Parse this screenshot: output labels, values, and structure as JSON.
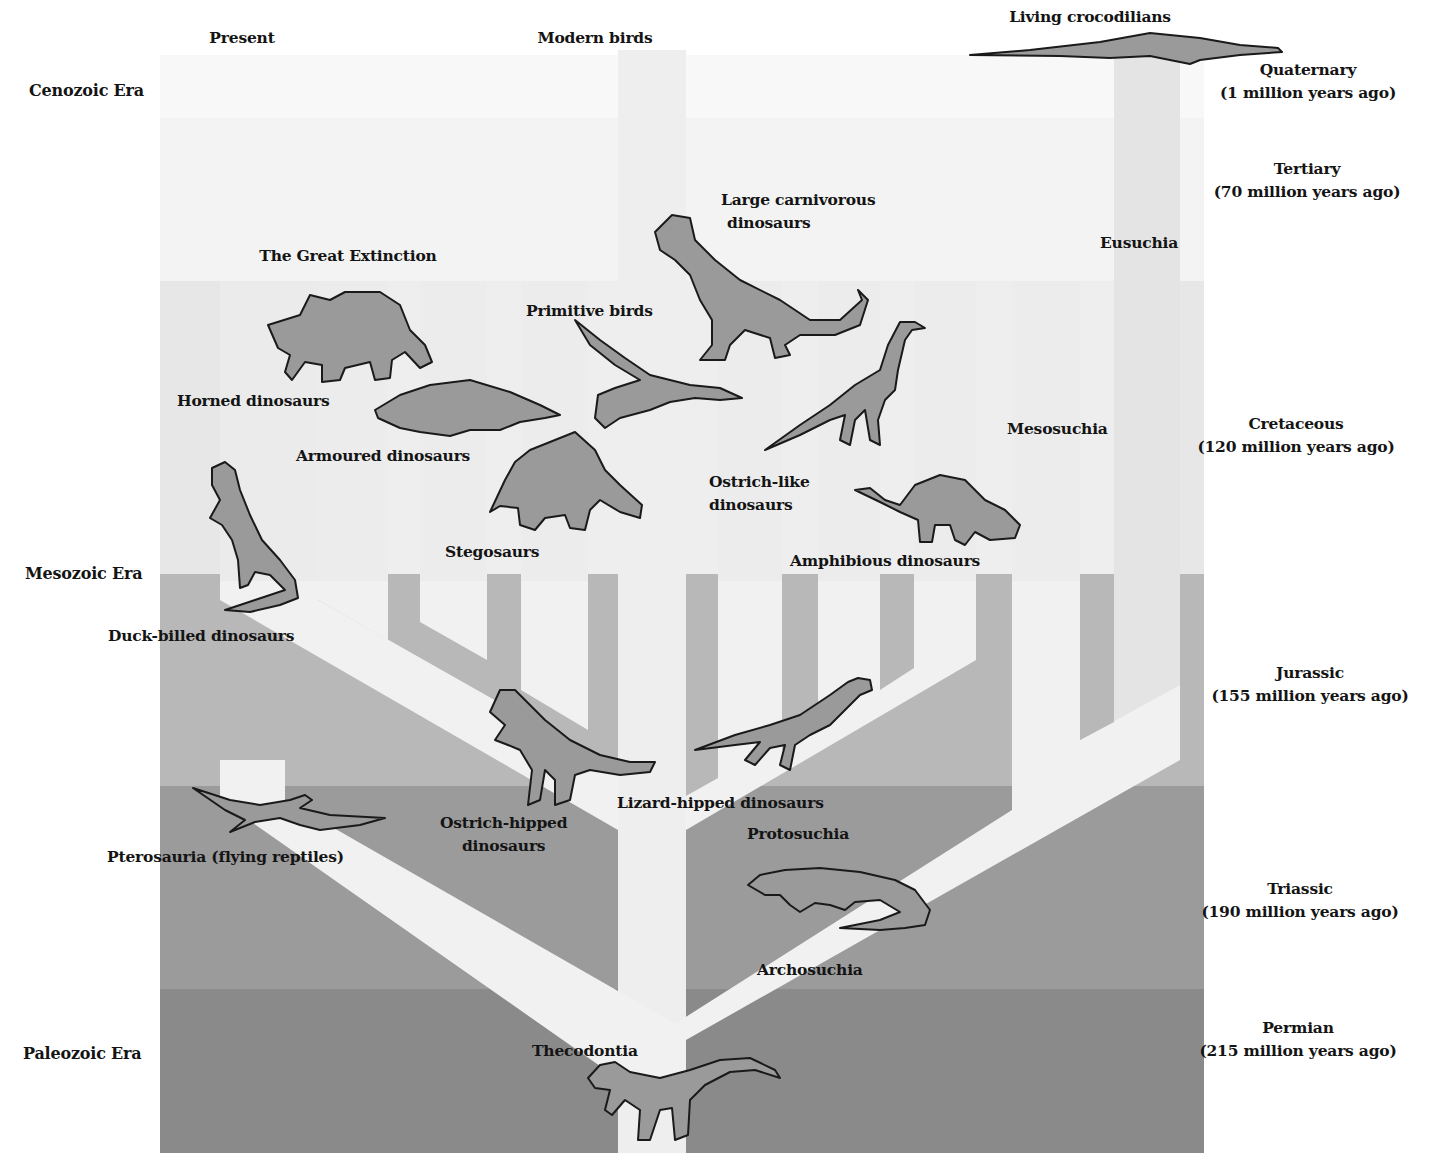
{
  "diagram": {
    "colors": {
      "cenozoic_band": "#f9f9f9",
      "cretaceous_band": "#e8e8e8",
      "jurassic_band": "#b9b9b9",
      "triassic_band": "#9c9c9c",
      "permian_band": "#8a8a8a",
      "branch": "#f1f1f1",
      "animal_fill": "#9a9a9a",
      "animal_stroke": "#1a1a1a",
      "text": "#141414"
    }
  },
  "eras": [
    {
      "label": "Cenozoic Era"
    },
    {
      "label": "Mesozoic Era"
    },
    {
      "label": "Paleozoic Era"
    }
  ],
  "periods": [
    {
      "name": "Quaternary",
      "age": "(1 million years ago)"
    },
    {
      "name": "Tertiary",
      "age": "(70 million years ago)"
    },
    {
      "name": "Cretaceous",
      "age": "(120 million years ago)"
    },
    {
      "name": "Jurassic",
      "age": "(155 million years ago)"
    },
    {
      "name": "Triassic",
      "age": "(190 million years ago)"
    },
    {
      "name": "Permian",
      "age": "(215 million years ago)"
    }
  ],
  "top_labels": {
    "present": "Present",
    "modern_birds": "Modern birds",
    "living_crocodilians": "Living crocodilians",
    "great_extinction": "The Great Extinction"
  },
  "groups": {
    "horned": "Horned dinosaurs",
    "armoured": "Armoured dinosaurs",
    "duck_billed": "Duck-billed dinosaurs",
    "stegosaurs": "Stegosaurs",
    "primitive_birds": "Primitive birds",
    "large_carnivorous_1": "Large carnivorous",
    "large_carnivorous_2": "dinosaurs",
    "ostrich_like_1": "Ostrich-like",
    "ostrich_like_2": "dinosaurs",
    "amphibious": "Amphibious dinosaurs",
    "mesosuchia": "Mesosuchia",
    "eusuchia": "Eusuchia",
    "pterosauria": "Pterosauria (flying reptiles)",
    "ostrich_hipped_1": "Ostrich-hipped",
    "ostrich_hipped_2": "dinosaurs",
    "lizard_hipped": "Lizard-hipped dinosaurs",
    "protosuchia": "Protosuchia",
    "archosuchia": "Archosuchia",
    "thecodontia": "Thecodontia"
  }
}
